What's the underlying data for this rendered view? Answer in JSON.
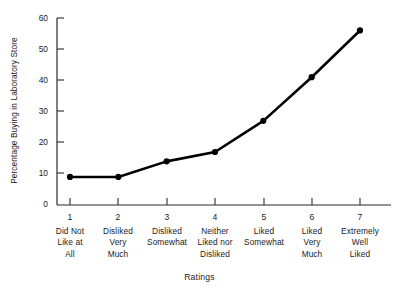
{
  "chart_data": {
    "type": "line",
    "title": "",
    "subtitle": "",
    "xlabel": "Ratings",
    "ylabel": "Percentage Buying in Laboratory Store",
    "x": [
      1,
      2,
      3,
      4,
      5,
      6,
      7
    ],
    "categories": [
      "1",
      "2",
      "3",
      "4",
      "5",
      "6",
      "7"
    ],
    "category_descriptions": [
      "Did Not\nLike at\nAll",
      "Disliked\nVery\nMuch",
      "Disliked\nSomewhat",
      "Neither\nLiked nor\nDisliked",
      "Liked\nSomewhat",
      "Liked\nVery\nMuch",
      "Extremely\nWell\nLiked"
    ],
    "values": [
      9,
      9,
      14,
      17,
      27,
      41,
      56
    ],
    "series": [
      {
        "name": "Percentage Buying in Laboratory Store",
        "values": [
          9,
          9,
          14,
          17,
          27,
          41,
          56
        ]
      }
    ],
    "ylim": [
      0,
      60
    ],
    "xlim": [
      1,
      7
    ],
    "yticks": [
      0,
      10,
      20,
      30,
      40,
      50,
      60
    ],
    "ytick_labels": [
      "0",
      "10",
      "20",
      "30",
      "40",
      "50",
      "60"
    ],
    "xticks": [
      1,
      2,
      3,
      4,
      5,
      6,
      7
    ],
    "xtick_labels": [
      "1",
      "2",
      "3",
      "4",
      "5",
      "6",
      "7"
    ],
    "grid": false,
    "legend": false,
    "legend_position": "none",
    "marker": "filled-circle",
    "line_color": "#000000",
    "marker_color": "#000000",
    "background_color": "#ffffff"
  },
  "axes": {
    "y_axis_title": "Percentage Buying in Laboratory Store",
    "x_axis_title": "Ratings"
  },
  "colors": {
    "line": "#000000",
    "axis": "#2b2b2b",
    "text": "#1a1a1a",
    "background": "#ffffff"
  }
}
